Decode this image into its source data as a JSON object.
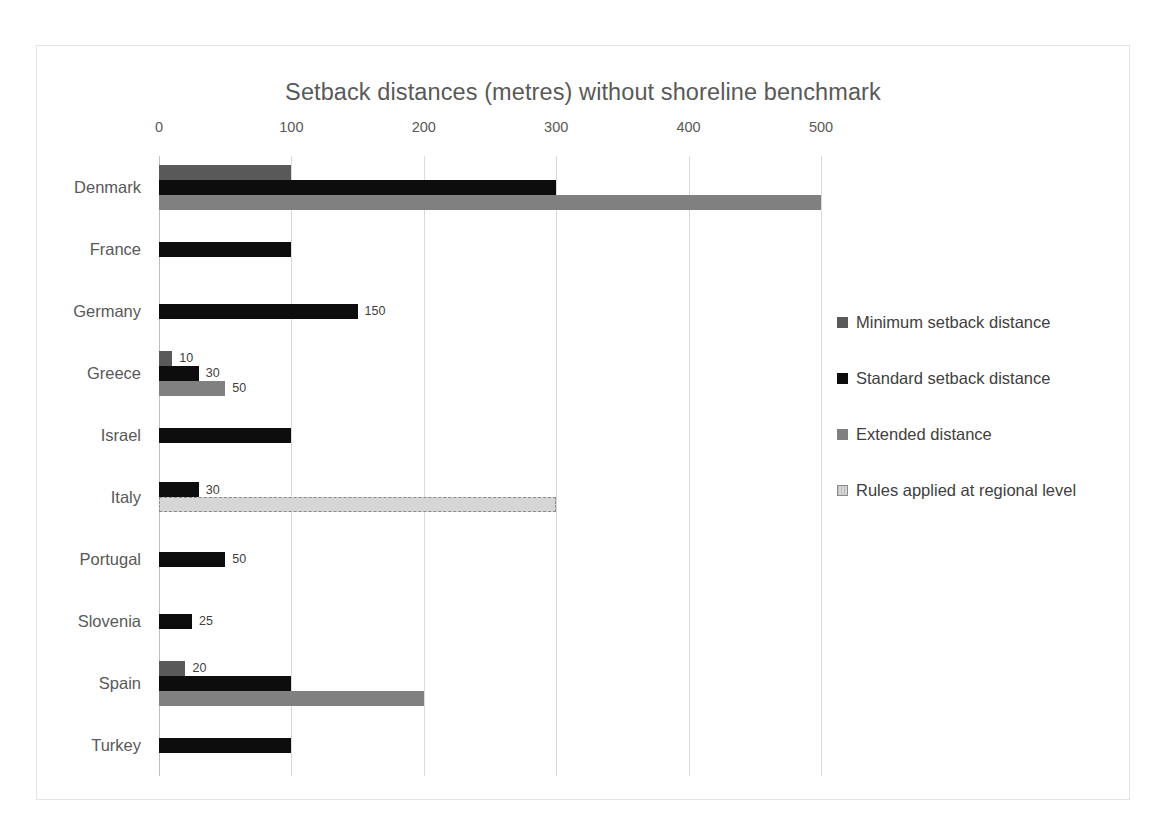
{
  "chart_data": {
    "type": "bar",
    "orientation": "horizontal",
    "title": "Setback distances (metres) without shoreline benchmark",
    "xlabel": "",
    "ylabel": "",
    "xlim": [
      0,
      500
    ],
    "xticks": [
      0,
      100,
      200,
      300,
      400,
      500
    ],
    "xtick_labels": [
      "0",
      "100",
      "200",
      "300",
      "400",
      "500"
    ],
    "grid": true,
    "legend_position": "right",
    "categories": [
      "Denmark",
      "France",
      "Germany",
      "Greece",
      "Israel",
      "Italy",
      "Portugal",
      "Slovenia",
      "Spain",
      "Turkey"
    ],
    "series": [
      {
        "name": "Minimum setback distance",
        "color": "#595959",
        "values": [
          100,
          null,
          null,
          10,
          null,
          null,
          null,
          null,
          20,
          null
        ]
      },
      {
        "name": "Standard setback distance",
        "color": "#0d0d0d",
        "values": [
          300,
          100,
          150,
          30,
          100,
          30,
          50,
          25,
          100,
          100
        ]
      },
      {
        "name": "Extended distance",
        "color": "#808080",
        "values": [
          500,
          null,
          null,
          50,
          null,
          null,
          null,
          null,
          200,
          null
        ]
      },
      {
        "name": "Rules applied at regional level",
        "color": "#d6d6d6",
        "values": [
          null,
          null,
          null,
          null,
          null,
          300,
          null,
          null,
          null,
          null
        ]
      }
    ],
    "data_labels": {
      "Denmark": {
        "minimum": "",
        "standard": "",
        "extended": ""
      },
      "Germany": {
        "standard": "150"
      },
      "Greece": {
        "minimum": "10",
        "standard": "30",
        "extended": "50"
      },
      "Italy": {
        "standard": "30"
      },
      "Portugal": {
        "standard": "50"
      },
      "Slovenia": {
        "standard": "25"
      },
      "Spain": {
        "minimum": "20"
      }
    }
  },
  "legend": {
    "items": [
      {
        "label": "Minimum setback distance",
        "marker": "minimum"
      },
      {
        "label": "Standard setback distance",
        "marker": "standard"
      },
      {
        "label": "Extended distance",
        "marker": "extended"
      },
      {
        "label": "Rules applied at regional level",
        "marker": "regional"
      }
    ]
  },
  "colors": {
    "minimum": "#595959",
    "standard": "#0d0d0d",
    "extended": "#808080",
    "regional": "#d6d6d6",
    "grid": "#d9d9d9",
    "text": "#595959",
    "frame": "#e4e4e4"
  }
}
